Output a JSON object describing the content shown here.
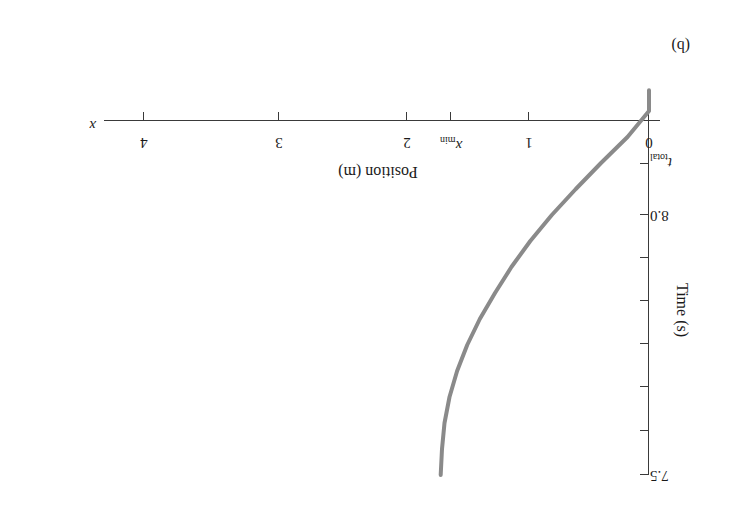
{
  "figure": {
    "panel_label": "(b)",
    "curve_color": "#8a8a8a",
    "axis_color": "#3a3a3a"
  },
  "chart_data": {
    "type": "line",
    "title": "",
    "orientation": "rotated-180",
    "xlabel": "Position (m)",
    "x_axis_symbol": "x",
    "ylabel": "Time (s)",
    "xlim": [
      0,
      4.6
    ],
    "ylim_labels": [
      "7.5",
      "8.0",
      "t_total"
    ],
    "x_ticks": [
      0,
      1,
      1.65,
      2,
      3,
      4
    ],
    "x_tick_labels": [
      "0",
      "1",
      "x_min",
      "2",
      "3",
      "4"
    ],
    "x_tick_label_special": "x_min",
    "y_ticks": [
      7.5,
      7.6,
      7.7,
      7.8,
      7.9,
      8.0,
      8.1,
      8.2
    ],
    "y_tick_labels": [
      "7.5",
      "",
      "",
      "",
      "",
      "8.0",
      "",
      "t_total"
    ],
    "grid": false,
    "legend": false,
    "series": [
      {
        "name": "position vs time",
        "comment": "parabolic trajectory: starts at x=0 at t=7.5 s, rises to maximum x_min at apex, then falls back",
        "t": [
          7.5,
          7.55,
          7.6,
          7.65,
          7.7,
          7.75,
          7.8,
          7.85,
          7.9,
          7.95,
          8.0,
          8.05,
          8.1,
          8.15,
          8.2,
          8.24
        ],
        "x": [
          1.65,
          1.64,
          1.62,
          1.58,
          1.52,
          1.44,
          1.34,
          1.22,
          1.09,
          0.94,
          0.77,
          0.58,
          0.38,
          0.17,
          0.0,
          0.0
        ]
      }
    ],
    "annotations": [
      {
        "text": "x_min",
        "meaning": "maximum position reached, apex of curve"
      },
      {
        "text": "t_total",
        "meaning": "total elapsed time, bottom of time axis"
      }
    ]
  },
  "axis_labels": {
    "x_title": "Position (m)",
    "x_symbol": "x",
    "y_title": "Time (s)",
    "x_tick_0": "0",
    "x_tick_1": "1",
    "x_tick_xmin_base": "x",
    "x_tick_xmin_sub": "min",
    "x_tick_2": "2",
    "x_tick_3": "3",
    "x_tick_4": "4",
    "y_tick_75": "7.5",
    "y_tick_80": "8.0",
    "y_tick_total_base": "t",
    "y_tick_total_sub": "total"
  }
}
